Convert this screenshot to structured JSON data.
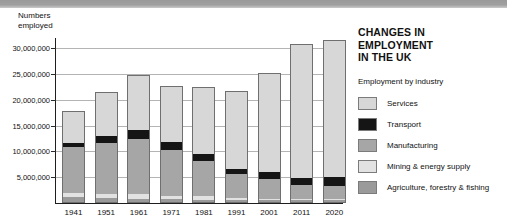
{
  "header": {
    "band_color": "#9a9a9a"
  },
  "panel": {
    "title": "CHANGES IN EMPLOYMENT\nIN THE UK",
    "legend_heading": "Employment by industry"
  },
  "chart_data": {
    "type": "bar",
    "stacked": true,
    "title": "CHANGES IN EMPLOYMENT IN THE UK",
    "subtitle": "Employment by industry",
    "xlabel": "",
    "ylabel": "Numbers\nemployed",
    "ylim": [
      0,
      32000000
    ],
    "ytick_values": [
      5000000,
      10000000,
      15000000,
      20000000,
      25000000,
      30000000
    ],
    "ytick_labels": [
      "5,000,000",
      "10,000,000",
      "15,000,000",
      "20,000,000",
      "25,000,000",
      "30,000,000"
    ],
    "grid": true,
    "legend_position": "right",
    "categories": [
      "1941",
      "1951",
      "1961",
      "1971",
      "1981",
      "1991",
      "2001",
      "2011",
      "2020"
    ],
    "series": [
      {
        "name": "Agriculture, forestry & fishing",
        "color": "#9a9a9a",
        "values": [
          900000,
          750000,
          650000,
          500000,
          450000,
          400000,
          350000,
          400000,
          400000
        ]
      },
      {
        "name": "Mining & energy supply",
        "color": "#e2e2e2",
        "values": [
          900000,
          900000,
          850000,
          600000,
          700000,
          400000,
          250000,
          200000,
          200000
        ]
      },
      {
        "name": "Manufacturing",
        "color": "#a6a6a6",
        "values": [
          9100000,
          10100000,
          10900000,
          9200000,
          6950000,
          4650000,
          3900000,
          2700000,
          2600000
        ]
      },
      {
        "name": "Transport",
        "color": "#151515",
        "values": [
          700000,
          1250000,
          1700000,
          1600000,
          1300000,
          1150000,
          1500000,
          1500000,
          1700000
        ]
      },
      {
        "name": "Services",
        "color": "#d7d7d7",
        "values": [
          6200000,
          8500000,
          10750000,
          10750000,
          13050000,
          15150000,
          19300000,
          26000000,
          26750000
        ]
      }
    ],
    "totals": [
      17800000,
      21500000,
      24850000,
      22650000,
      22450000,
      21750000,
      25300000,
      30800000,
      31650000
    ]
  }
}
